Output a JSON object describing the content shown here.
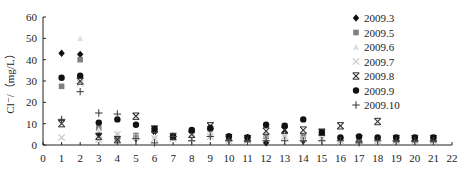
{
  "chart_data": {
    "type": "scatter",
    "title": "",
    "xlabel": "",
    "ylabel": "Cl⁻/（mg/L）",
    "xlim": [
      0,
      22
    ],
    "ylim": [
      0,
      60
    ],
    "x_ticks": [
      0,
      1,
      2,
      3,
      4,
      5,
      6,
      7,
      8,
      9,
      10,
      11,
      12,
      13,
      14,
      15,
      16,
      17,
      18,
      19,
      20,
      21,
      22
    ],
    "y_ticks": [
      0,
      10,
      20,
      30,
      40,
      50,
      60
    ],
    "grid": false,
    "legend_position": "upper right (inside)",
    "series": [
      {
        "name": "2009.3",
        "marker": "diamond",
        "color": "#111111",
        "points": [
          [
            1,
            43
          ],
          [
            2,
            42.5
          ],
          [
            3,
            5
          ],
          [
            4,
            3
          ],
          [
            5,
            3
          ],
          [
            6,
            6
          ],
          [
            7,
            4
          ],
          [
            8,
            6
          ],
          [
            9,
            7
          ],
          [
            10,
            4
          ],
          [
            11,
            3.5
          ],
          [
            12,
            1
          ],
          [
            13,
            6
          ],
          [
            14,
            2
          ],
          [
            15,
            5
          ],
          [
            16,
            3
          ],
          [
            17,
            3
          ],
          [
            18,
            3
          ],
          [
            19,
            3
          ],
          [
            20,
            3
          ],
          [
            21,
            3
          ]
        ]
      },
      {
        "name": "2009.5",
        "marker": "square",
        "color": "#808080",
        "points": [
          [
            1,
            27.5
          ],
          [
            2,
            40
          ],
          [
            3,
            8
          ],
          [
            4,
            3
          ],
          [
            5,
            4.5
          ],
          [
            6,
            7
          ],
          [
            7,
            4
          ],
          [
            8,
            6.5
          ],
          [
            9,
            7.5
          ],
          [
            10,
            3.5
          ],
          [
            11,
            3
          ],
          [
            12,
            4
          ],
          [
            13,
            9
          ],
          [
            14,
            4
          ],
          [
            15,
            5.5
          ],
          [
            16,
            3
          ],
          [
            17,
            3
          ],
          [
            18,
            3
          ],
          [
            19,
            3
          ],
          [
            20,
            3
          ],
          [
            21,
            3
          ]
        ]
      },
      {
        "name": "2009.6",
        "marker": "triangle",
        "color": "#e0e0e0",
        "points": [
          [
            1,
            12
          ],
          [
            2,
            50
          ],
          [
            3,
            7
          ],
          [
            4,
            5.5
          ],
          [
            5,
            3.5
          ],
          [
            6,
            4
          ],
          [
            7,
            3
          ],
          [
            8,
            5
          ],
          [
            9,
            5
          ],
          [
            10,
            3
          ],
          [
            11,
            3
          ],
          [
            12,
            6
          ],
          [
            13,
            5
          ],
          [
            14,
            3
          ],
          [
            15,
            4
          ],
          [
            16,
            2
          ],
          [
            17,
            2
          ],
          [
            18,
            2
          ],
          [
            19,
            2
          ],
          [
            20,
            2
          ],
          [
            21,
            2
          ]
        ]
      },
      {
        "name": "2009.7",
        "marker": "x",
        "color": "#c8c8c8",
        "points": [
          [
            1,
            3.5
          ],
          [
            2,
            29
          ],
          [
            3,
            2.5
          ],
          [
            4,
            5
          ],
          [
            5,
            4
          ],
          [
            6,
            3
          ],
          [
            7,
            3
          ],
          [
            8,
            3
          ],
          [
            9,
            4
          ],
          [
            10,
            2
          ],
          [
            11,
            2
          ],
          [
            12,
            3
          ],
          [
            13,
            4
          ],
          [
            14,
            3
          ],
          [
            15,
            3
          ],
          [
            16,
            2
          ],
          [
            17,
            2
          ],
          [
            18,
            2
          ],
          [
            19,
            2
          ],
          [
            20,
            2
          ],
          [
            21,
            2
          ]
        ]
      },
      {
        "name": "2009.8",
        "marker": "star",
        "color": "#333333",
        "points": [
          [
            1,
            10
          ],
          [
            2,
            30
          ],
          [
            3,
            4
          ],
          [
            4,
            2.5
          ],
          [
            5,
            13.5
          ],
          [
            6,
            7.5
          ],
          [
            7,
            4
          ],
          [
            8,
            5
          ],
          [
            9,
            9
          ],
          [
            10,
            3.5
          ],
          [
            11,
            3
          ],
          [
            12,
            6.5
          ],
          [
            13,
            7
          ],
          [
            14,
            7
          ],
          [
            15,
            6
          ],
          [
            16,
            9
          ],
          [
            17,
            3
          ],
          [
            18,
            11
          ],
          [
            19,
            3
          ],
          [
            20,
            3
          ],
          [
            21,
            3
          ]
        ]
      },
      {
        "name": "2009.9",
        "marker": "circle",
        "color": "#111111",
        "points": [
          [
            1,
            31.5
          ],
          [
            2,
            32.5
          ],
          [
            3,
            10.5
          ],
          [
            4,
            12
          ],
          [
            5,
            9.5
          ],
          [
            6,
            7.5
          ],
          [
            7,
            4
          ],
          [
            8,
            7
          ],
          [
            9,
            8
          ],
          [
            10,
            4
          ],
          [
            11,
            3.5
          ],
          [
            12,
            9.5
          ],
          [
            13,
            9
          ],
          [
            14,
            12
          ],
          [
            15,
            6
          ],
          [
            16,
            3.5
          ],
          [
            17,
            4
          ],
          [
            18,
            3.5
          ],
          [
            19,
            3.5
          ],
          [
            20,
            3.5
          ],
          [
            21,
            3.5
          ]
        ]
      },
      {
        "name": "2009.10",
        "marker": "plus",
        "color": "#444444",
        "points": [
          [
            1,
            12
          ],
          [
            2,
            25
          ],
          [
            3,
            15
          ],
          [
            4,
            14.5
          ],
          [
            5,
            3
          ],
          [
            6,
            1
          ],
          [
            7,
            4
          ],
          [
            8,
            2
          ],
          [
            9,
            4
          ],
          [
            10,
            2
          ],
          [
            11,
            2
          ],
          [
            12,
            2
          ],
          [
            13,
            2
          ],
          [
            14,
            2
          ],
          [
            15,
            2
          ],
          [
            16,
            2
          ],
          [
            17,
            1
          ],
          [
            18,
            2
          ],
          [
            19,
            2
          ],
          [
            20,
            2
          ],
          [
            21,
            2
          ]
        ]
      }
    ]
  }
}
